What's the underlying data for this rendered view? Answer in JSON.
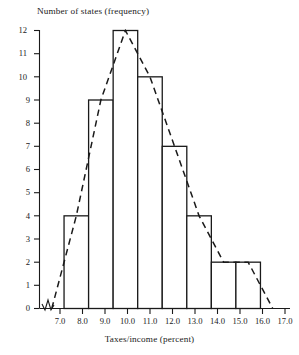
{
  "chart_data": {
    "type": "bar",
    "title": "",
    "ylabel": "Number of states (frequency)",
    "xlabel": "Taxes/income (percent)",
    "grid": false,
    "legend": null,
    "xlim": [
      7.0,
      17.0
    ],
    "ylim": [
      0,
      12
    ],
    "x_ticks": [
      "7.0",
      "8.0",
      "9.0",
      "10.0",
      "11.0",
      "12.0",
      "13.0",
      "14.0",
      "15.0",
      "16.0",
      "17.0"
    ],
    "x_tick_values": [
      7.0,
      8.0,
      9.0,
      10.0,
      11.0,
      12.0,
      13.0,
      14.0,
      15.0,
      16.0,
      17.0
    ],
    "y_ticks": [
      "0",
      "1",
      "2",
      "3",
      "4",
      "5",
      "6",
      "7",
      "8",
      "9",
      "10",
      "11",
      "12"
    ],
    "y_tick_values": [
      0,
      1,
      2,
      3,
      4,
      5,
      6,
      7,
      8,
      9,
      10,
      11,
      12
    ],
    "axis_break": true,
    "bins": [
      {
        "label": "8.0-9.0",
        "start": 8.0,
        "end": 9.0,
        "midpoint": 8.5,
        "value": 4
      },
      {
        "label": "9.0-10.0",
        "start": 9.0,
        "end": 10.0,
        "midpoint": 9.5,
        "value": 9
      },
      {
        "label": "10.0-11.0",
        "start": 10.0,
        "end": 11.0,
        "midpoint": 10.5,
        "value": 12
      },
      {
        "label": "11.0-12.0",
        "start": 11.0,
        "end": 12.0,
        "midpoint": 11.5,
        "value": 10
      },
      {
        "label": "12.0-13.0",
        "start": 12.0,
        "end": 13.0,
        "midpoint": 12.5,
        "value": 7
      },
      {
        "label": "13.0-14.0",
        "start": 13.0,
        "end": 14.0,
        "midpoint": 13.5,
        "value": 4
      },
      {
        "label": "14.0-15.0",
        "start": 14.0,
        "end": 15.0,
        "midpoint": 14.5,
        "value": 2
      },
      {
        "label": "15.0-16.0",
        "start": 15.0,
        "end": 16.0,
        "midpoint": 15.5,
        "value": 2
      }
    ],
    "categories": [
      "8.0-9.0",
      "9.0-10.0",
      "10.0-11.0",
      "11.0-12.0",
      "12.0-13.0",
      "13.0-14.0",
      "14.0-15.0",
      "15.0-16.0"
    ],
    "values": [
      4,
      9,
      12,
      10,
      7,
      4,
      2,
      2
    ],
    "overlay": {
      "name": "frequency polygon",
      "style": "dashed",
      "x": [
        7.5,
        8.5,
        9.5,
        10.5,
        11.5,
        12.5,
        13.5,
        14.5,
        15.5,
        16.5
      ],
      "y": [
        0,
        4,
        9,
        12,
        10,
        7,
        4,
        2,
        2,
        0
      ]
    },
    "colors": {
      "bar_stroke": "#1a1a1a",
      "bar_fill": "#ffffff",
      "polygon": "#1a1a1a",
      "axis": "#1a1a1a",
      "background": "#ffffff"
    }
  }
}
